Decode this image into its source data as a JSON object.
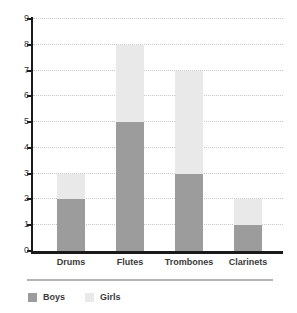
{
  "chart_data": {
    "type": "bar",
    "subtype": "stacked-bar",
    "title": "",
    "subtitle": "",
    "xlabel": "",
    "ylabel": "",
    "categories": [
      "Drums",
      "Flutes",
      "Trombones",
      "Clarinets"
    ],
    "series": [
      {
        "name": "Boys",
        "values": [
          2,
          5,
          3,
          1
        ],
        "color": "#9c9c9c"
      },
      {
        "name": "Girls",
        "values": [
          1,
          3,
          4,
          1
        ],
        "color": "#e9e9e9"
      }
    ],
    "totals": [
      3,
      8,
      7,
      2
    ],
    "ylim": [
      0,
      9
    ],
    "ytick_labels": [
      "0",
      "1",
      "2",
      "3",
      "4",
      "5",
      "6",
      "7",
      "8",
      "9"
    ],
    "ytick_values": [
      0,
      1,
      2,
      3,
      4,
      5,
      6,
      7,
      8,
      9
    ],
    "grid": true,
    "grid_style": "dotted",
    "grid_axis": "y",
    "legend_position": "bottom-left",
    "axis_color": "#1a1a1a",
    "grid_color": "#c8c8c8",
    "background": "#ffffff"
  },
  "legend": {
    "items": [
      {
        "label": "Boys",
        "swatch": "#9c9c9c"
      },
      {
        "label": "Girls",
        "swatch": "#e9e9e9"
      }
    ]
  }
}
